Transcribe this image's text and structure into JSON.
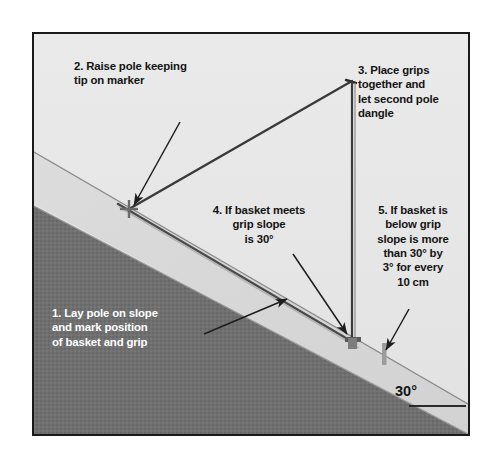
{
  "figure": {
    "background_color": "#ffffff",
    "frame": {
      "border_color": "#1a1a1a",
      "sky_color": "#e8e8e8",
      "slope_band_color": "#d8d8d8",
      "ground_color": "#6f6f6f"
    }
  },
  "callouts": {
    "step1": "1. Lay pole on slope\nand mark position\nof basket and grip",
    "step2": "2. Raise pole keeping\ntip on marker",
    "step3": "3. Place grips\ntogether and\nlet second pole\ndangle",
    "step4": "4. If basket meets\ngrip slope\nis 30°",
    "step5": "5. If basket is\nbelow grip\nslope is more\nthan 30° by\n3° for every\n10 cm"
  },
  "labels": {
    "slope_angle": "30°"
  },
  "scene": {
    "marker_point": "tip-marker-on-slope",
    "apex_point": "grips-together-apex",
    "basket_point": "basket-mark-on-slope",
    "second_mark": "grip-mark-on-slope",
    "reference_line": "horizontal-reference-line"
  },
  "colors": {
    "pole_dark": "#3a3a3a",
    "pole_light": "#a8a8a8",
    "arrow": "#1e1e1e",
    "slope_edge": "#7a7a7a",
    "text_dark": "#141414",
    "text_light": "#ffffff"
  }
}
